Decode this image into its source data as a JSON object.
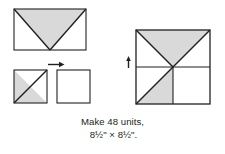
{
  "figure": {
    "kind": "quilt-block-piecing-diagram",
    "colors": {
      "outline": "#231f20",
      "shaded_fill": "#d9d9d9",
      "unshaded_fill": "#ffffff",
      "background": "#ffffff",
      "text": "#231f20"
    },
    "step_top": {
      "name": "flying-geese-rectangle",
      "description": "Rectangle with two diagonals from top corners meeting at bottom center",
      "center_triangle_fill": "shaded",
      "side_triangles_fill": "unshaded"
    },
    "step_bottom": {
      "name": "half-square-triangle-pair",
      "left_square": {
        "name": "half-square-triangle-unit",
        "diagonal": "bottom-left-to-top-right",
        "lower_left_fill": "shaded",
        "upper_right_fill": "unshaded"
      },
      "right_square": {
        "name": "plain-square-unit",
        "fill": "unshaded"
      },
      "arrow": {
        "name": "press-direction-arrow",
        "direction": "right"
      }
    },
    "step_assembled": {
      "name": "assembled-block",
      "quadrants": {
        "top_left": "unshaded",
        "top_right": "unshaded",
        "bottom_left_lower": "unshaded",
        "bottom_left_upper": "shaded",
        "bottom_right": "unshaded",
        "center_flying_geese": "shaded"
      },
      "arrow": {
        "name": "press-direction-arrow",
        "direction": "up"
      }
    }
  },
  "caption": {
    "line1": "Make 48 units,",
    "line2": "8½\" × 8½\"."
  }
}
